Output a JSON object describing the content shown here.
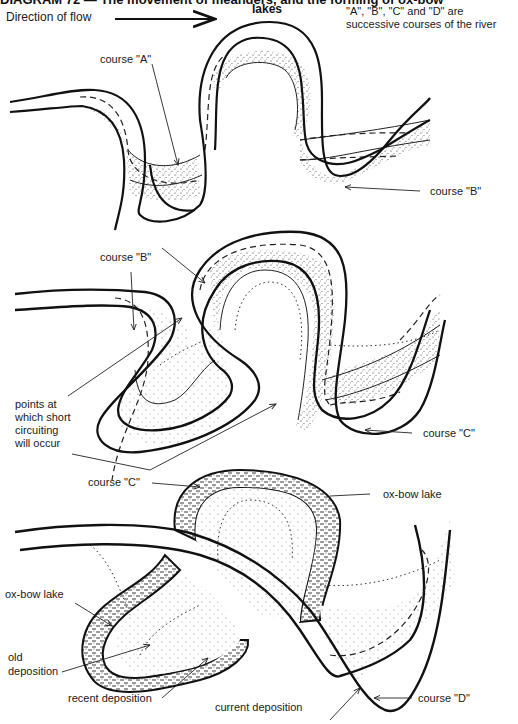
{
  "title": {
    "text": "DIAGRAM 72 — The movement of meanders, and the forming of ox-bow",
    "subtitle": "lakes"
  },
  "note": "\"A\", \"B\", \"C\" and \"D\" are successive courses of the river",
  "flow": {
    "label": "Direction of flow",
    "icon": "arrow-right-icon"
  },
  "panels": [
    {
      "name": "stage-1",
      "labels": [
        {
          "id": "course-a",
          "text": "course \"A\""
        },
        {
          "id": "course-b",
          "text": "course \"B\""
        }
      ]
    },
    {
      "name": "stage-2",
      "labels": [
        {
          "id": "course-b",
          "text": "course \"B\""
        },
        {
          "id": "short-circuit",
          "lines": [
            "points at",
            "which short",
            "circuiting",
            "will occur"
          ]
        },
        {
          "id": "course-c",
          "text": "course \"C\""
        }
      ]
    },
    {
      "name": "stage-3",
      "labels": [
        {
          "id": "course-c",
          "text": "course \"C\""
        },
        {
          "id": "ox-bow-lake-right",
          "text": "ox-bow lake"
        },
        {
          "id": "ox-bow-lake-left",
          "text": "ox-bow lake"
        },
        {
          "id": "old-deposition",
          "lines": [
            "old",
            "deposition"
          ]
        },
        {
          "id": "recent-deposition",
          "text": "recent deposition"
        },
        {
          "id": "current-deposition",
          "text": "current deposition"
        },
        {
          "id": "course-d",
          "text": "course \"D\""
        }
      ]
    }
  ],
  "legend": {
    "solid_bank": "current river bank",
    "dashed_bank": "previous course",
    "stippled": "deposition",
    "hatched": "ox-bow lake water"
  }
}
